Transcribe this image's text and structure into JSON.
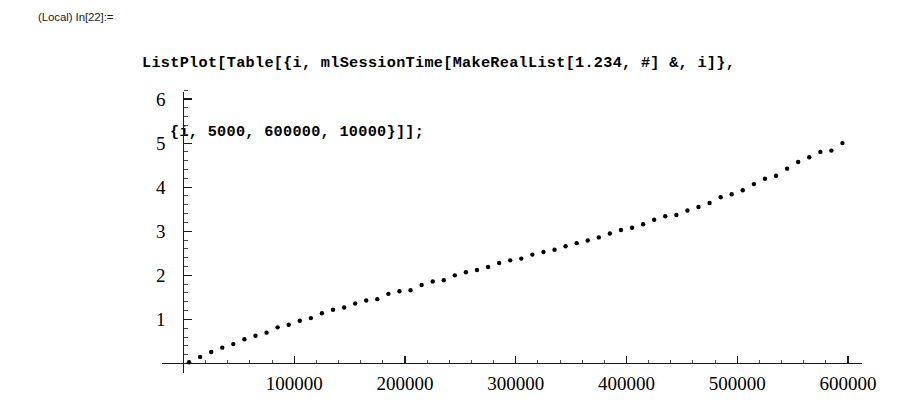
{
  "notebook": {
    "input_cell": {
      "prompt_label": "(Local) In[22]:=",
      "code_line_1": "ListPlot[Table[{i, mlSessionTime[MakeRealList[1.234, #] &, i]},",
      "code_line_2": "{i, 5000, 600000, 10000}]];"
    }
  },
  "chart_data": {
    "type": "scatter",
    "title": "",
    "xlabel": "",
    "ylabel": "",
    "xlim": [
      0,
      617000
    ],
    "ylim": [
      0,
      6.3
    ],
    "grid": false,
    "legend": "none",
    "axis_color": "#000000",
    "point_color": "#000000",
    "point_radius": 2.2,
    "x_ticks_major": [
      100000,
      200000,
      300000,
      400000,
      500000,
      600000
    ],
    "x_tick_labels": [
      "100000",
      "200000",
      "300000",
      "400000",
      "500000",
      "600000"
    ],
    "x_tick_minor_step": 20000,
    "y_ticks_major": [
      1,
      2,
      3,
      4,
      5,
      6
    ],
    "y_tick_labels": [
      "1",
      "2",
      "3",
      "4",
      "5",
      "6"
    ],
    "y_tick_minor_step": 0.2,
    "x": [
      5000,
      15000,
      25000,
      35000,
      45000,
      55000,
      65000,
      75000,
      85000,
      95000,
      105000,
      115000,
      125000,
      135000,
      145000,
      155000,
      165000,
      175000,
      185000,
      195000,
      205000,
      215000,
      225000,
      235000,
      245000,
      255000,
      265000,
      275000,
      285000,
      295000,
      305000,
      315000,
      325000,
      335000,
      345000,
      355000,
      365000,
      375000,
      385000,
      395000,
      405000,
      415000,
      425000,
      435000,
      445000,
      455000,
      465000,
      475000,
      485000,
      495000,
      505000,
      515000,
      525000,
      535000,
      545000,
      555000,
      565000,
      575000,
      585000,
      595000
    ],
    "y": [
      0.03,
      0.15,
      0.26,
      0.36,
      0.44,
      0.55,
      0.63,
      0.7,
      0.82,
      0.88,
      0.97,
      1.03,
      1.14,
      1.22,
      1.27,
      1.36,
      1.43,
      1.46,
      1.58,
      1.64,
      1.66,
      1.78,
      1.86,
      1.89,
      2.0,
      2.07,
      2.12,
      2.19,
      2.28,
      2.34,
      2.38,
      2.47,
      2.53,
      2.58,
      2.66,
      2.73,
      2.79,
      2.86,
      2.95,
      3.03,
      3.08,
      3.16,
      3.26,
      3.34,
      3.37,
      3.47,
      3.55,
      3.64,
      3.77,
      3.84,
      3.93,
      4.07,
      4.19,
      4.26,
      4.42,
      4.57,
      4.68,
      4.8,
      4.83,
      5.0
    ]
  }
}
